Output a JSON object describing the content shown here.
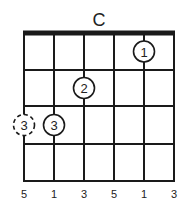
{
  "chord": {
    "name": "C",
    "strings": 6,
    "frets_shown": 4,
    "nut_visible": true,
    "fingers": [
      {
        "string": 5,
        "fret": 1,
        "finger": "1",
        "optional": false
      },
      {
        "string": 3,
        "fret": 2,
        "finger": "2",
        "optional": false
      },
      {
        "string": 2,
        "fret": 3,
        "finger": "3",
        "optional": false
      },
      {
        "string": 1,
        "fret": 3,
        "finger": "3",
        "optional": true
      }
    ],
    "interval_labels": [
      "5",
      "1",
      "3",
      "5",
      "1",
      "3"
    ]
  },
  "colors": {
    "line": "#1a1a1a",
    "text": "#222222",
    "background": "#ffffff"
  }
}
